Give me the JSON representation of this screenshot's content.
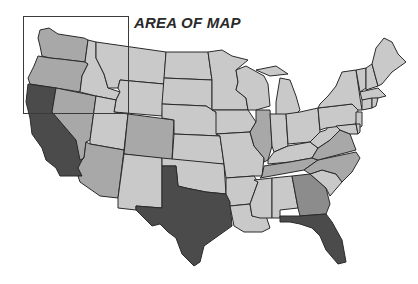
{
  "map": {
    "title": "AREA OF MAP",
    "region": "Contiguous United States",
    "shading": {
      "dark": "#4b4b4b",
      "darker_medium": "#8c8c8c",
      "medium": "#a8a8a8",
      "light": "#c9c9c9",
      "border": "#2a2a2a",
      "water": "#ffffff"
    },
    "highlight_box": {
      "x": 23,
      "y": 16,
      "width": 105,
      "height": 97
    },
    "states": [
      {
        "abbr": "WA",
        "shade": "medium",
        "d": "M40,30 L49,28 L58,34 L84,38 L88,40 L85,62 L60,59 L50,58 L42,56 L40,46 L38,38 Z"
      },
      {
        "abbr": "OR",
        "shade": "medium",
        "d": "M38,56 L50,58 L60,59 L85,62 L88,64 L82,76 L80,92 L56,88 L30,84 L28,78 L34,66 Z"
      },
      {
        "abbr": "CA",
        "shade": "dark",
        "d": "M28,84 L56,88 L52,112 L76,140 L82,160 L78,168 L82,176 L60,176 L56,168 L46,160 L42,148 L32,134 L30,118 L26,102 Z"
      },
      {
        "abbr": "NV",
        "shade": "medium",
        "d": "M56,88 L96,96 L90,140 L86,142 L84,158 L80,160 L76,140 L52,112 Z"
      },
      {
        "abbr": "ID",
        "shade": "light",
        "d": "M88,40 L96,42 L96,58 L104,74 L108,88 L120,92 L116,100 L96,96 L80,92 L82,76 L88,64 L85,62 Z"
      },
      {
        "abbr": "MT",
        "shade": "light",
        "d": "M96,42 L166,52 L164,84 L120,80 L118,88 L108,88 L104,74 L96,58 Z"
      },
      {
        "abbr": "WY",
        "shade": "light",
        "d": "M120,80 L164,84 L162,116 L114,112 L116,100 L120,92 L118,88 Z"
      },
      {
        "abbr": "UT",
        "shade": "light",
        "d": "M96,96 L116,100 L114,112 L128,114 L124,150 L90,144 L90,140 Z"
      },
      {
        "abbr": "AZ",
        "shade": "medium",
        "d": "M90,144 L124,150 L118,198 L100,196 L80,182 L78,176 L82,176 L78,168 L82,160 L84,158 L86,142 Z"
      },
      {
        "abbr": "CO",
        "shade": "medium",
        "d": "M128,114 L174,120 L172,160 L124,154 Z"
      },
      {
        "abbr": "NM",
        "shade": "light",
        "d": "M124,154 L162,158 L162,208 L136,206 L136,210 L118,208 L118,198 Z"
      },
      {
        "abbr": "ND",
        "shade": "light",
        "d": "M166,52 L208,52 L212,80 L164,78 Z"
      },
      {
        "abbr": "SD",
        "shade": "light",
        "d": "M164,78 L212,80 L212,110 L206,106 L162,104 Z"
      },
      {
        "abbr": "NE",
        "shade": "light",
        "d": "M162,104 L206,106 L216,112 L220,136 L174,134 L174,120 L162,118 Z"
      },
      {
        "abbr": "KS",
        "shade": "light",
        "d": "M174,134 L220,136 L224,164 L172,162 Z"
      },
      {
        "abbr": "OK",
        "shade": "light",
        "d": "M162,158 L224,164 L226,194 L206,192 L186,188 L178,186 L176,166 L162,166 Z"
      },
      {
        "abbr": "TX",
        "shade": "dark",
        "d": "M162,166 L176,166 L178,186 L186,188 L206,192 L226,194 L230,202 L232,226 L218,236 L204,246 L200,262 L194,266 L182,254 L176,238 L168,232 L160,224 L152,226 L140,214 L136,210 L136,206 L162,208 Z"
      },
      {
        "abbr": "MN",
        "shade": "light",
        "d": "M208,52 L222,50 L232,56 L248,60 L236,70 L238,82 L236,90 L246,98 L248,110 L212,110 L212,80 Z"
      },
      {
        "abbr": "IA",
        "shade": "light",
        "d": "M212,110 L248,110 L256,122 L250,132 L216,134 L216,112 Z"
      },
      {
        "abbr": "MO",
        "shade": "light",
        "d": "M216,134 L250,132 L254,146 L264,158 L262,176 L254,176 L226,178 L224,164 L220,136 Z"
      },
      {
        "abbr": "AR",
        "shade": "light",
        "d": "M226,178 L254,176 L258,182 L250,204 L230,206 L230,202 L226,194 Z"
      },
      {
        "abbr": "LA",
        "shade": "light",
        "d": "M230,206 L250,204 L252,216 L266,216 L270,228 L262,232 L244,232 L234,226 Z"
      },
      {
        "abbr": "WI",
        "shade": "light",
        "d": "M236,70 L246,66 L264,76 L268,84 L270,106 L256,110 L248,110 L246,98 L236,90 L238,82 Z"
      },
      {
        "abbr": "IL",
        "shade": "medium",
        "d": "M256,110 L270,110 L272,146 L268,160 L264,162 L264,158 L254,146 L250,132 L256,122 Z"
      },
      {
        "abbr": "MI",
        "shade": "light",
        "d": "M280,78 L290,80 L296,96 L300,110 L296,114 L276,116 L276,102 Z M256,70 L276,66 L288,74 L270,76 Z"
      },
      {
        "abbr": "IN",
        "shade": "light",
        "d": "M270,114 L286,114 L288,146 L274,152 L272,146 Z"
      },
      {
        "abbr": "OH",
        "shade": "light",
        "d": "M286,114 L300,112 L318,108 L320,132 L310,142 L288,144 Z"
      },
      {
        "abbr": "KY",
        "shade": "light",
        "d": "M268,160 L274,152 L288,146 L310,142 L318,148 L312,158 L290,162 L268,164 Z"
      },
      {
        "abbr": "TN",
        "shade": "medium",
        "d": "M262,176 L264,166 L290,162 L312,158 L318,160 L304,170 L260,178 Z"
      },
      {
        "abbr": "MS",
        "shade": "light",
        "d": "M254,180 L272,178 L272,218 L260,218 L252,216 L250,204 L258,182 Z"
      },
      {
        "abbr": "AL",
        "shade": "light",
        "d": "M272,178 L292,176 L298,208 L280,210 L280,218 L272,218 Z"
      },
      {
        "abbr": "GA",
        "shade": "darker_medium",
        "d": "M292,176 L310,174 L326,188 L330,204 L326,214 L300,216 L298,208 Z"
      },
      {
        "abbr": "FL",
        "shade": "dark",
        "d": "M280,216 L300,216 L326,214 L332,222 L342,240 L346,262 L338,264 L326,250 L320,236 L312,228 L300,224 L290,222 L280,222 Z"
      },
      {
        "abbr": "SC",
        "shade": "light",
        "d": "M310,174 L322,170 L336,174 L342,182 L330,196 L326,188 Z"
      },
      {
        "abbr": "NC",
        "shade": "medium",
        "d": "M304,170 L318,160 L356,152 L360,158 L352,172 L342,182 L336,174 L322,170 L310,174 Z"
      },
      {
        "abbr": "VA",
        "shade": "medium",
        "d": "M312,158 L318,148 L330,140 L340,130 L350,134 L356,150 L318,160 Z"
      },
      {
        "abbr": "WV",
        "shade": "light",
        "d": "M318,148 L310,142 L320,132 L326,130 L330,124 L336,126 L340,130 L330,140 Z"
      },
      {
        "abbr": "PA",
        "shade": "light",
        "d": "M318,108 L352,104 L358,110 L356,124 L326,128 L320,130 Z"
      },
      {
        "abbr": "NY",
        "shade": "light",
        "d": "M320,104 L328,96 L336,86 L342,72 L356,70 L360,98 L362,110 L358,110 L352,104 L318,108 Z"
      },
      {
        "abbr": "NJ",
        "shade": "light",
        "d": "M356,112 L362,112 L362,126 L356,130 Z"
      },
      {
        "abbr": "MD",
        "shade": "light",
        "d": "M336,126 L356,124 L358,134 L350,134 L340,130 Z"
      },
      {
        "abbr": "DE",
        "shade": "light",
        "d": "M356,124 L360,124 L360,132 L358,134 Z"
      },
      {
        "abbr": "VT",
        "shade": "light",
        "d": "M356,70 L366,68 L366,88 L360,92 Z"
      },
      {
        "abbr": "NH",
        "shade": "light",
        "d": "M366,68 L372,64 L378,86 L366,90 Z"
      },
      {
        "abbr": "ME",
        "shade": "light",
        "d": "M372,64 L376,48 L384,38 L392,42 L398,54 L406,62 L392,72 L382,84 L378,86 Z"
      },
      {
        "abbr": "MA",
        "shade": "light",
        "d": "M360,92 L378,88 L386,96 L378,98 L362,100 Z"
      },
      {
        "abbr": "CT",
        "shade": "light",
        "d": "M362,100 L372,98 L372,108 L362,110 Z"
      },
      {
        "abbr": "RI",
        "shade": "light",
        "d": "M372,98 L378,98 L376,106 L372,108 Z"
      }
    ]
  }
}
